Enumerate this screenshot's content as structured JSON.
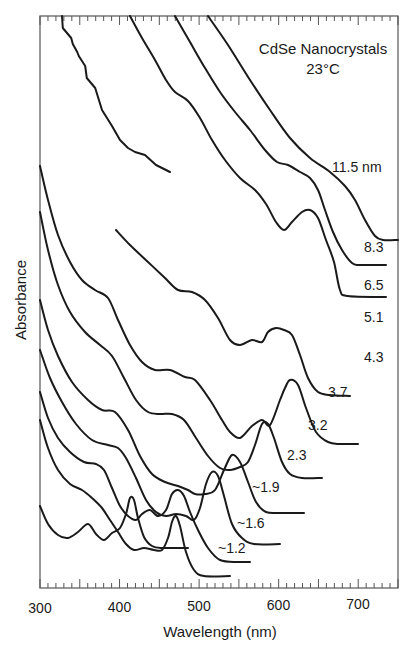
{
  "chart_data": {
    "type": "line",
    "title": "CdSe Nanocrystals",
    "subtitle": "23°C",
    "xlabel": "Wavelength (nm)",
    "ylabel": "Absorbance",
    "xlim": [
      300,
      750
    ],
    "x_ticks": [
      300,
      400,
      500,
      600,
      700
    ],
    "y_ticks": [],
    "grid": false,
    "legend": "inline labels at right end of each trace",
    "units_series_label": "nm",
    "series": [
      {
        "name": "11.5 nm",
        "label": "11.5 nm",
        "label_pos": [
          332,
          172
        ],
        "points": [
          [
            208,
            16
          ],
          [
            228,
            45
          ],
          [
            250,
            80
          ],
          [
            270,
            110
          ],
          [
            290,
            138
          ],
          [
            310,
            158
          ],
          [
            330,
            172
          ],
          [
            345,
            186
          ],
          [
            355,
            200
          ],
          [
            365,
            220
          ],
          [
            375,
            236
          ],
          [
            383,
            240
          ],
          [
            398,
            240
          ]
        ]
      },
      {
        "name": "8.3 nm",
        "label": "8.3",
        "label_pos": [
          364,
          252
        ],
        "points": [
          [
            175,
            16
          ],
          [
            190,
            42
          ],
          [
            205,
            68
          ],
          [
            220,
            92
          ],
          [
            235,
            112
          ],
          [
            250,
            130
          ],
          [
            265,
            150
          ],
          [
            277,
            162
          ],
          [
            288,
            165
          ],
          [
            300,
            172
          ],
          [
            310,
            178
          ],
          [
            318,
            190
          ],
          [
            325,
            210
          ],
          [
            333,
            232
          ],
          [
            342,
            250
          ],
          [
            352,
            263
          ],
          [
            360,
            265
          ],
          [
            386,
            265
          ]
        ]
      },
      {
        "name": "6.5 nm",
        "label": "6.5",
        "label_pos": [
          364,
          290
        ],
        "points": [
          [
            130,
            16
          ],
          [
            142,
            38
          ],
          [
            155,
            60
          ],
          [
            166,
            80
          ],
          [
            175,
            92
          ],
          [
            188,
            101
          ],
          [
            200,
            118
          ],
          [
            212,
            140
          ],
          [
            225,
            160
          ],
          [
            240,
            178
          ],
          [
            255,
            190
          ],
          [
            266,
            204
          ],
          [
            276,
            222
          ],
          [
            284,
            230
          ],
          [
            292,
            222
          ],
          [
            302,
            212
          ],
          [
            310,
            210
          ],
          [
            318,
            218
          ],
          [
            326,
            240
          ],
          [
            334,
            262
          ],
          [
            340,
            290
          ],
          [
            348,
            296
          ],
          [
            386,
            297
          ]
        ]
      },
      {
        "name": "5.1 nm",
        "label": "5.1",
        "label_pos": [
          364,
          322
        ],
        "points": [
          [
            116,
            230
          ],
          [
            130,
            245
          ],
          [
            148,
            262
          ],
          [
            165,
            278
          ],
          [
            178,
            290
          ],
          [
            192,
            292
          ],
          [
            205,
            300
          ],
          [
            218,
            318
          ],
          [
            230,
            340
          ],
          [
            240,
            345
          ],
          [
            252,
            340
          ],
          [
            262,
            342
          ],
          [
            268,
            332
          ],
          [
            276,
            328
          ],
          [
            284,
            330
          ],
          [
            292,
            335
          ],
          [
            300,
            355
          ],
          [
            308,
            378
          ],
          [
            318,
            392
          ],
          [
            330,
            395
          ],
          [
            370,
            330
          ]
        ],
        "note": "path ends at right with flat baseline near label 5.1"
      },
      {
        "name": "4.3 nm",
        "label": "4.3",
        "label_pos": [
          364,
          362
        ],
        "points": [
          [
            40,
            166
          ],
          [
            48,
            200
          ],
          [
            58,
            235
          ],
          [
            70,
            262
          ],
          [
            82,
            280
          ],
          [
            95,
            290
          ],
          [
            108,
            298
          ],
          [
            118,
            320
          ],
          [
            130,
            345
          ],
          [
            142,
            362
          ],
          [
            155,
            370
          ],
          [
            170,
            370
          ],
          [
            185,
            377
          ],
          [
            195,
            380
          ],
          [
            210,
            400
          ],
          [
            222,
            420
          ],
          [
            230,
            432
          ],
          [
            240,
            438
          ],
          [
            252,
            426
          ],
          [
            262,
            420
          ],
          [
            270,
            425
          ],
          [
            280,
            400
          ],
          [
            285,
            388
          ],
          [
            290,
            380
          ],
          [
            298,
            385
          ],
          [
            306,
            408
          ],
          [
            316,
            432
          ],
          [
            328,
            442
          ],
          [
            340,
            444
          ],
          [
            358,
            444
          ]
        ]
      },
      {
        "name": "3.7 nm",
        "label": "3.7",
        "label_pos": [
          328,
          397
        ],
        "points": [
          [
            40,
            212
          ],
          [
            48,
            250
          ],
          [
            58,
            285
          ],
          [
            70,
            312
          ],
          [
            85,
            332
          ],
          [
            100,
            345
          ],
          [
            112,
            356
          ],
          [
            124,
            378
          ],
          [
            136,
            400
          ],
          [
            148,
            412
          ],
          [
            160,
            414
          ],
          [
            172,
            414
          ],
          [
            184,
            420
          ],
          [
            196,
            438
          ],
          [
            208,
            456
          ],
          [
            220,
            468
          ],
          [
            230,
            470
          ],
          [
            240,
            467
          ],
          [
            248,
            462
          ],
          [
            255,
            445
          ],
          [
            262,
            424
          ],
          [
            268,
            424
          ],
          [
            274,
            438
          ],
          [
            282,
            462
          ],
          [
            290,
            474
          ],
          [
            302,
            478
          ],
          [
            322,
            478
          ]
        ]
      },
      {
        "name": "3.2 nm",
        "label": "3.2",
        "label_pos": [
          308,
          430
        ],
        "points": [
          [
            40,
            300
          ],
          [
            48,
            330
          ],
          [
            58,
            356
          ],
          [
            72,
            382
          ],
          [
            88,
            400
          ],
          [
            102,
            410
          ],
          [
            115,
            412
          ],
          [
            128,
            430
          ],
          [
            140,
            456
          ],
          [
            152,
            474
          ],
          [
            165,
            482
          ],
          [
            178,
            486
          ],
          [
            188,
            490
          ],
          [
            195,
            494
          ],
          [
            205,
            494
          ],
          [
            215,
            490
          ],
          [
            224,
            470
          ],
          [
            232,
            455
          ],
          [
            240,
            462
          ],
          [
            248,
            482
          ],
          [
            256,
            502
          ],
          [
            266,
            512
          ],
          [
            280,
            513
          ],
          [
            304,
            513
          ]
        ]
      },
      {
        "name": "2.3 nm",
        "label": "2.3",
        "label_pos": [
          287,
          460
        ],
        "points": [
          [
            40,
            350
          ],
          [
            50,
            378
          ],
          [
            62,
            402
          ],
          [
            76,
            424
          ],
          [
            92,
            440
          ],
          [
            108,
            445
          ],
          [
            118,
            448
          ],
          [
            126,
            458
          ],
          [
            136,
            478
          ],
          [
            146,
            500
          ],
          [
            156,
            512
          ],
          [
            166,
            516
          ],
          [
            176,
            514
          ],
          [
            186,
            516
          ],
          [
            194,
            520
          ],
          [
            200,
            508
          ],
          [
            206,
            484
          ],
          [
            212,
            472
          ],
          [
            218,
            476
          ],
          [
            224,
            496
          ],
          [
            232,
            524
          ],
          [
            242,
            538
          ],
          [
            254,
            544
          ],
          [
            280,
            544
          ]
        ]
      },
      {
        "name": "~1.9 nm",
        "label": "~1.9",
        "label_pos": [
          252,
          492
        ],
        "points": [
          [
            40,
            392
          ],
          [
            48,
            418
          ],
          [
            58,
            438
          ],
          [
            70,
            452
          ],
          [
            84,
            462
          ],
          [
            96,
            464
          ],
          [
            104,
            470
          ],
          [
            112,
            488
          ],
          [
            120,
            506
          ],
          [
            128,
            516
          ],
          [
            136,
            520
          ],
          [
            142,
            514
          ],
          [
            150,
            510
          ],
          [
            158,
            516
          ],
          [
            166,
            510
          ],
          [
            172,
            494
          ],
          [
            178,
            490
          ],
          [
            184,
            496
          ],
          [
            190,
            512
          ],
          [
            198,
            530
          ],
          [
            208,
            548
          ],
          [
            220,
            560
          ],
          [
            238,
            562
          ],
          [
            250,
            562
          ]
        ]
      },
      {
        "name": "~1.6 nm",
        "label": "~1.6",
        "label_pos": [
          237,
          528
        ],
        "points": [
          [
            40,
            420
          ],
          [
            48,
            448
          ],
          [
            58,
            470
          ],
          [
            70,
            484
          ],
          [
            82,
            490
          ],
          [
            92,
            498
          ],
          [
            102,
            508
          ],
          [
            110,
            520
          ],
          [
            118,
            532
          ],
          [
            126,
            544
          ],
          [
            134,
            550
          ],
          [
            144,
            548
          ],
          [
            154,
            550
          ],
          [
            162,
            550
          ],
          [
            168,
            538
          ],
          [
            172,
            522
          ],
          [
            176,
            516
          ],
          [
            180,
            526
          ],
          [
            186,
            552
          ],
          [
            194,
            570
          ],
          [
            204,
            576
          ],
          [
            230,
            576
          ]
        ]
      },
      {
        "name": "~1.2 nm",
        "label": "~1.2",
        "label_pos": [
          218,
          553
        ],
        "points": [
          [
            40,
            506
          ],
          [
            48,
            524
          ],
          [
            58,
            535
          ],
          [
            68,
            538
          ],
          [
            78,
            532
          ],
          [
            88,
            524
          ],
          [
            96,
            534
          ],
          [
            104,
            540
          ],
          [
            112,
            533
          ],
          [
            120,
            528
          ],
          [
            126,
            514
          ],
          [
            130,
            498
          ],
          [
            134,
            500
          ],
          [
            138,
            518
          ],
          [
            144,
            537
          ],
          [
            152,
            546
          ],
          [
            162,
            548
          ],
          [
            188,
            548
          ]
        ]
      }
    ],
    "noisy_high_energy_trace": {
      "name": "noise segment on 6.5/8.3 upper region",
      "points": [
        [
          62,
          16
        ],
        [
          64,
          28
        ],
        [
          70,
          38
        ],
        [
          74,
          44
        ],
        [
          76,
          52
        ],
        [
          80,
          56
        ],
        [
          84,
          66
        ],
        [
          88,
          78
        ],
        [
          94,
          88
        ],
        [
          102,
          110
        ],
        [
          112,
          126
        ],
        [
          120,
          140
        ],
        [
          128,
          148
        ],
        [
          135,
          152
        ],
        [
          145,
          155
        ],
        [
          156,
          165
        ],
        [
          170,
          172
        ]
      ]
    }
  },
  "axis": {
    "x_tick_labels": [
      "300",
      "400",
      "500",
      "600",
      "700"
    ],
    "x_label": "Wavelength (nm)",
    "y_label": "Absorbance"
  },
  "annotation": {
    "title_line1": "CdSe Nanocrystals",
    "title_line2": "23°C"
  }
}
